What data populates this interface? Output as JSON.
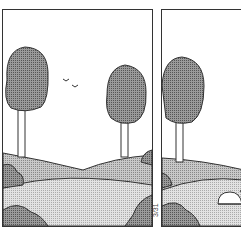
{
  "comic": {
    "panels": [
      {
        "id": "panel-1",
        "elements": [
          "left-tree",
          "right-tree",
          "birds",
          "hills",
          "bushes",
          "meadow"
        ]
      },
      {
        "id": "panel-2",
        "elements": [
          "left-tree",
          "hills",
          "bushes",
          "meadow",
          "golf-cart"
        ]
      }
    ],
    "date_label": "3/31"
  },
  "colors": {
    "ink": "#333333",
    "foliage": "#8a8a8a",
    "hill": "#b8b8b8",
    "meadow": "#d6d6d6",
    "sky": "#ffffff"
  }
}
